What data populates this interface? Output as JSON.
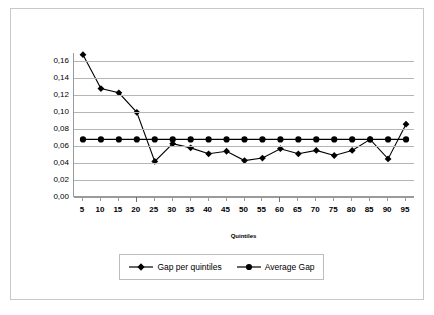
{
  "chart_data": {
    "type": "line",
    "title": "",
    "xlabel": "Quintiles",
    "ylabel": "",
    "categories": [
      5,
      10,
      15,
      20,
      25,
      30,
      35,
      40,
      45,
      50,
      55,
      60,
      65,
      70,
      75,
      80,
      85,
      90,
      95
    ],
    "xtick_labels": [
      "5",
      "10",
      "15",
      "20",
      "25",
      "30",
      "35",
      "40",
      "45",
      "50",
      "55",
      "60",
      "65",
      "70",
      "75",
      "80",
      "85",
      "90",
      "95"
    ],
    "ytick_labels": [
      "0,00",
      "0,02",
      "0,04",
      "0,06",
      "0,08",
      "0,10",
      "0,12",
      "0,14",
      "0,16"
    ],
    "ytick_values": [
      0.0,
      0.02,
      0.04,
      0.06,
      0.08,
      0.1,
      0.12,
      0.14,
      0.16
    ],
    "ylim": [
      0.0,
      0.17
    ],
    "grid": true,
    "legend_position": "bottom",
    "series": [
      {
        "name": "Gap per quintiles",
        "marker": "diamond",
        "color": "#000000",
        "values": [
          0.168,
          0.128,
          0.123,
          0.1,
          0.042,
          0.063,
          0.058,
          0.051,
          0.054,
          0.043,
          0.046,
          0.057,
          0.051,
          0.055,
          0.049,
          0.055,
          0.068,
          0.045,
          0.086
        ]
      },
      {
        "name": "Average Gap",
        "marker": "circle",
        "color": "#000000",
        "values": [
          0.068,
          0.068,
          0.068,
          0.068,
          0.068,
          0.068,
          0.068,
          0.068,
          0.068,
          0.068,
          0.068,
          0.068,
          0.068,
          0.068,
          0.068,
          0.068,
          0.068,
          0.068,
          0.068
        ]
      }
    ]
  },
  "legend": {
    "entries": [
      {
        "label": "Gap per quintiles"
      },
      {
        "label": "Average Gap"
      }
    ]
  }
}
